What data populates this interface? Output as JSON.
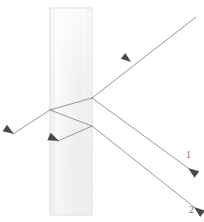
{
  "figure": {
    "kind": "optics-ray-diagram",
    "width": 204,
    "height": 222,
    "background_color": "#ffffff"
  },
  "slab": {
    "name": "glass-slab",
    "left": 50,
    "top": 8,
    "width": 42,
    "height": 207,
    "fill_color": "#f2f2f2",
    "edge_color": "#d0d0d0",
    "highlight_color": "#fbfbfb"
  },
  "rays": {
    "stroke_color": "#8c8c8c",
    "stroke_width": 0.9,
    "arrow_color": "#4a4a4a",
    "items": [
      {
        "name": "incident-ray",
        "description": "incoming ray from upper right to right face of slab",
        "from": [
          196,
          17
        ],
        "to": [
          92,
          98
        ],
        "arrow_at": [
          134,
          60
        ],
        "arrow_angle": 218
      },
      {
        "name": "refracted-ray-inside-slab",
        "description": "refracted ray travelling left inside the slab to the left face",
        "from": [
          92,
          98
        ],
        "to": [
          50,
          110
        ],
        "arrow_at": null,
        "arrow_angle": null
      },
      {
        "name": "transmitted-ray-left",
        "description": "ray emerging from the left face travelling down-left",
        "from": [
          50,
          110
        ],
        "to": [
          13,
          134
        ],
        "arrow_at": [
          18,
          131
        ],
        "arrow_angle": 213
      },
      {
        "name": "internally-reflected-ray",
        "description": "internally reflected ray from left face back toward right face",
        "from": [
          50,
          110
        ],
        "to": [
          92,
          126
        ],
        "arrow_at": null,
        "arrow_angle": null
      },
      {
        "name": "second-internal-ray",
        "description": "ray reflected at the right face travelling back down-left inside the slab",
        "from": [
          92,
          126
        ],
        "to": [
          58,
          141
        ],
        "arrow_at": [
          63,
          139
        ],
        "arrow_angle": 204
      },
      {
        "name": "exit-ray-1",
        "description": "first ray exiting the right face, labelled 1",
        "from": [
          92,
          98
        ],
        "to": [
          188,
          168
        ],
        "arrow_at": [
          184,
          165
        ],
        "arrow_angle": 36
      },
      {
        "name": "exit-ray-2",
        "description": "second ray exiting the right face, labelled 2",
        "from": [
          92,
          126
        ],
        "to": [
          194,
          207
        ],
        "arrow_at": [
          190,
          204
        ],
        "arrow_angle": 38
      }
    ]
  },
  "labels": [
    {
      "name": "ray-label-1",
      "text": "1",
      "subscript": "",
      "x": 186,
      "y": 150
    },
    {
      "name": "ray-label-2",
      "text": "2",
      "subscript": "",
      "x": 189,
      "y": 207
    }
  ]
}
